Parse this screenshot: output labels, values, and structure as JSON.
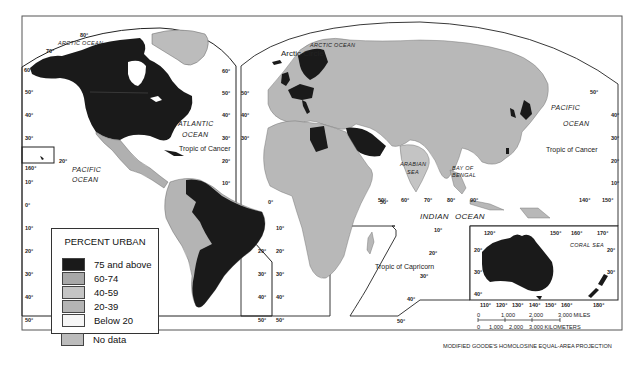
{
  "map": {
    "projection": "MODIFIED GOODE'S HOMOLOSINE EQUAL-AREA PROJECTION",
    "colors": {
      "urban_75_above": "#1a1a1a",
      "urban_60_74": "#a8a8a8",
      "urban_40_59": "#c4c4c4",
      "urban_20_39": "#b4b4b4",
      "urban_below_20": "#f6f6f6",
      "no_data": "#bcbcbc",
      "water": "#ffffff",
      "frame": "#333333"
    },
    "legend": {
      "title": "PERCENT URBAN",
      "items": [
        {
          "label": "75 and above",
          "color": "#1a1a1a"
        },
        {
          "label": "60-74",
          "color": "#a8a8a8"
        },
        {
          "label": "40-59",
          "color": "#c4c4c4"
        },
        {
          "label": "20-39",
          "color": "#b4b4b4"
        },
        {
          "label": "Below 20",
          "color": "#f6f6f6"
        },
        {
          "label": "No data",
          "color": "#bcbcbc"
        }
      ]
    },
    "ocean_labels": {
      "arctic_ocean_west": "ARCTIC OCEAN",
      "arctic_ocean_east": "ARCTIC OCEAN",
      "atlantic_1": "ATLANTIC",
      "atlantic_2": "OCEAN",
      "pacific_west_1": "PACIFIC",
      "pacific_west_2": "OCEAN",
      "pacific_east_1": "PACIFIC",
      "pacific_east_2": "OCEAN",
      "indian_1": "INDIAN",
      "indian_2": "OCEAN",
      "arabian_sea_1": "ARABIAN",
      "arabian_sea_2": "SEA",
      "bay_of_bengal_1": "BAY OF",
      "bay_of_bengal_2": "BENGAL",
      "coral_sea": "CORAL SEA"
    },
    "line_labels": {
      "arctic_circle": "Arctic Circle",
      "tropic_cancer_west": "Tropic of Cancer",
      "tropic_cancer_east": "Tropic of Cancer",
      "tropic_capricorn": "Tropic of Capricorn"
    },
    "graticule": {
      "left_lat": [
        "60°",
        "50°",
        "40°",
        "30°",
        "20°",
        "10°",
        "0°",
        "10°",
        "20°",
        "30°",
        "40°",
        "50°"
      ],
      "atlantic_west_lat": [
        "60°",
        "50°",
        "40°",
        "30°",
        "20°",
        "10°",
        "20°",
        "30°",
        "40°",
        "50°"
      ],
      "atlantic_east_lat": [
        "50°",
        "40°",
        "30°",
        "0°",
        "10°",
        "20°",
        "30°",
        "40°",
        "50°"
      ],
      "top_lon": [
        "80°",
        "70°"
      ],
      "hawaii": [
        "160°",
        "20°"
      ],
      "indian_lon": [
        "50°",
        "60°",
        "70°",
        "80°",
        "90°"
      ],
      "indian_lat": [
        "10°",
        "20°",
        "30°",
        "40°",
        "50°",
        "10°"
      ],
      "east_lat": [
        "50°",
        "40°",
        "30°",
        "20°",
        "10°"
      ],
      "east_lon": [
        "140°",
        "150°"
      ],
      "africa_lon": "50°",
      "inset_top_lon": [
        "120°",
        "150°",
        "160°",
        "170°"
      ],
      "inset_bottom_lon": [
        "110°",
        "120°",
        "130°",
        "140°",
        "150°",
        "160°",
        "180°"
      ],
      "inset_lat_left": [
        "20°",
        "30°",
        "40°"
      ],
      "inset_lat_right": [
        "20°",
        "30°"
      ]
    },
    "scale": {
      "miles": [
        "0",
        "1,000",
        "2,000",
        "3,000 MILES"
      ],
      "km": [
        "0",
        "1,000",
        "2,000",
        "3,000 KILOMETERS"
      ]
    }
  }
}
